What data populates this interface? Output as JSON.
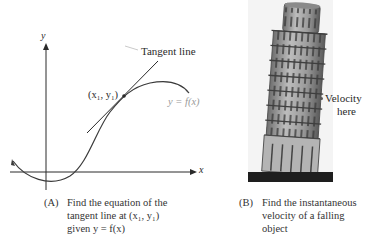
{
  "panel_a": {
    "axis_y_label": "y",
    "axis_x_label": "x",
    "tangent_label": "Tangent line",
    "point_label": "(x₁, y₁)",
    "curve_label": "y = f(x)",
    "caption_tag": "(A)",
    "caption_lines": [
      "Find the equation of the",
      "tangent line at (x₁, y₁)",
      "given y = f(x)"
    ]
  },
  "panel_b": {
    "image_subject": "Leaning Tower of Pisa",
    "marker_label_line1": "Velocity",
    "marker_label_line2": "here",
    "caption_tag": "(B)",
    "caption_lines": [
      "Find the instantaneous",
      "velocity of a falling",
      "object"
    ]
  },
  "colors": {
    "ink": "#2a2a2a",
    "curve_label": "#9a9a9a",
    "background": "#ffffff"
  }
}
